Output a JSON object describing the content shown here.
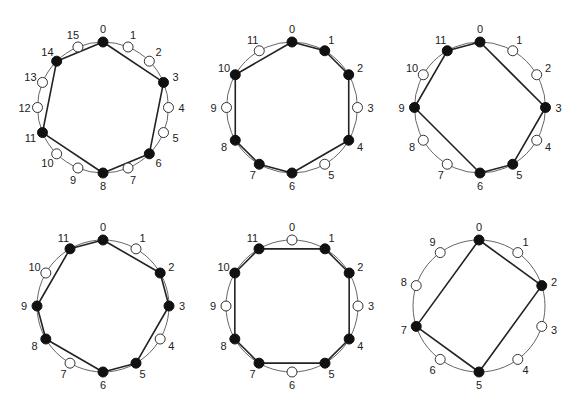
{
  "figure": {
    "width": 579,
    "height": 406,
    "colors": {
      "ring": "#666666",
      "edge": "#222222",
      "filled_node": "#111111",
      "empty_node_fill": "#ffffff",
      "empty_node_stroke": "#333333",
      "label": "#222222"
    },
    "node_radius": 5,
    "label_offset": 13,
    "diagrams": [
      {
        "id": "d1",
        "cx": 103,
        "cy": 107.5,
        "r": 65.5,
        "n": 16,
        "labels": [
          "0",
          "1",
          "2",
          "3",
          "4",
          "5",
          "6",
          "7",
          "8",
          "9",
          "10",
          "11",
          "12",
          "13",
          "14",
          "15"
        ],
        "filled": [
          0,
          3,
          6,
          8,
          11,
          14
        ]
      },
      {
        "id": "d2",
        "cx": 292,
        "cy": 107.5,
        "r": 65.5,
        "n": 12,
        "labels": [
          "0",
          "1",
          "2",
          "3",
          "4",
          "5",
          "6",
          "7",
          "8",
          "9",
          "10",
          "11"
        ],
        "filled": [
          0,
          1,
          2,
          4,
          6,
          7,
          8,
          10
        ]
      },
      {
        "id": "d3",
        "cx": 480,
        "cy": 107.5,
        "r": 65.5,
        "n": 12,
        "labels": [
          "0",
          "1",
          "2",
          "3",
          "4",
          "5",
          "6",
          "7",
          "8",
          "9",
          "10",
          "11"
        ],
        "filled": [
          0,
          3,
          5,
          6,
          9,
          11
        ]
      },
      {
        "id": "d4",
        "cx": 103,
        "cy": 306,
        "r": 66,
        "n": 12,
        "labels": [
          "0",
          "1",
          "2",
          "3",
          "4",
          "5",
          "6",
          "7",
          "8",
          "9",
          "10",
          "11"
        ],
        "filled": [
          0,
          2,
          3,
          5,
          6,
          8,
          9,
          11
        ]
      },
      {
        "id": "d5",
        "cx": 292,
        "cy": 306,
        "r": 66,
        "n": 12,
        "labels": [
          "0",
          "1",
          "2",
          "3",
          "4",
          "5",
          "6",
          "7",
          "8",
          "9",
          "10",
          "11"
        ],
        "filled": [
          1,
          2,
          4,
          5,
          7,
          8,
          10,
          11
        ]
      },
      {
        "id": "d6",
        "cx": 479,
        "cy": 306,
        "r": 66,
        "n": 10,
        "labels": [
          "0",
          "1",
          "2",
          "3",
          "4",
          "5",
          "6",
          "7",
          "8",
          "9"
        ],
        "filled": [
          0,
          2,
          5,
          7
        ]
      }
    ]
  }
}
